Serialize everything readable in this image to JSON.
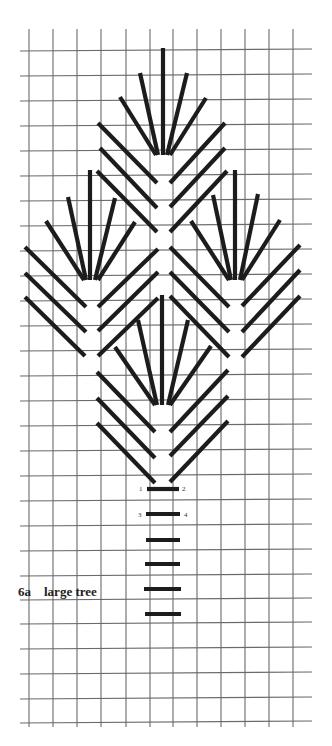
{
  "figure": {
    "id": "6a",
    "title": "large tree"
  },
  "grid": {
    "columns_x": [
      29,
      53,
      77,
      101,
      126,
      150,
      173,
      197,
      221,
      245,
      269,
      293
    ],
    "rows_y": [
      51,
      76,
      101,
      126,
      151,
      176,
      201,
      226,
      251,
      276,
      301,
      326,
      351,
      376,
      401,
      426,
      451,
      476,
      501,
      526,
      551,
      576,
      600,
      624,
      649,
      674,
      699,
      723
    ],
    "h_line_x_range": [
      20,
      312
    ],
    "v_line_y_range": [
      29,
      727
    ],
    "line_color": "#6a6a6a"
  },
  "stitch_color": "#1c1c1c",
  "fans": [
    {
      "name": "top-fan",
      "strokes": [
        [
          163,
          48,
          163,
          155
        ],
        [
          140,
          73,
          158,
          155
        ],
        [
          187,
          73,
          167,
          155
        ],
        [
          120,
          97,
          156,
          155
        ],
        [
          206,
          98,
          170,
          155
        ]
      ]
    },
    {
      "name": "left-fan",
      "strokes": [
        [
          90,
          170,
          90,
          280
        ],
        [
          68,
          197,
          86,
          280
        ],
        [
          115,
          198,
          95,
          280
        ],
        [
          46,
          221,
          84,
          280
        ],
        [
          135,
          222,
          98,
          280
        ]
      ]
    },
    {
      "name": "right-fan",
      "strokes": [
        [
          235,
          170,
          235,
          280
        ],
        [
          213,
          195,
          231,
          280
        ],
        [
          258,
          194,
          240,
          280
        ],
        [
          191,
          221,
          229,
          280
        ],
        [
          280,
          220,
          242,
          280
        ]
      ]
    },
    {
      "name": "bottom-fan",
      "strokes": [
        [
          162,
          295,
          162,
          405
        ],
        [
          138,
          320,
          157,
          405
        ],
        [
          188,
          320,
          168,
          405
        ],
        [
          115,
          347,
          155,
          405
        ],
        [
          211,
          346,
          170,
          405
        ]
      ]
    }
  ],
  "chevrons": [
    {
      "name": "top-chevrons",
      "strokes": [
        [
          98,
          123,
          157,
          183
        ],
        [
          100,
          148,
          157,
          208
        ],
        [
          97,
          171,
          157,
          232
        ],
        [
          225,
          123,
          170,
          183
        ],
        [
          225,
          148,
          170,
          207
        ],
        [
          227,
          171,
          170,
          232
        ]
      ]
    },
    {
      "name": "left-chevrons",
      "strokes": [
        [
          25,
          247,
          86,
          307
        ],
        [
          25,
          273,
          86,
          332
        ],
        [
          25,
          297,
          85,
          356
        ],
        [
          158,
          249,
          98,
          307
        ],
        [
          158,
          272,
          98,
          331
        ],
        [
          158,
          298,
          98,
          356
        ]
      ]
    },
    {
      "name": "right-chevrons",
      "strokes": [
        [
          170,
          247,
          229,
          307
        ],
        [
          170,
          272,
          229,
          332
        ],
        [
          170,
          296,
          229,
          357
        ],
        [
          300,
          245,
          242,
          306
        ],
        [
          300,
          270,
          242,
          332
        ],
        [
          300,
          296,
          242,
          357
        ]
      ]
    },
    {
      "name": "bottom-chevrons",
      "strokes": [
        [
          97,
          372,
          155,
          432
        ],
        [
          97,
          398,
          155,
          458
        ],
        [
          97,
          423,
          155,
          483
        ],
        [
          228,
          370,
          170,
          432
        ],
        [
          228,
          396,
          170,
          456
        ],
        [
          228,
          421,
          170,
          482
        ]
      ]
    }
  ],
  "trunk": {
    "bars": [
      [
        147,
        489,
        179,
        489
      ],
      [
        146,
        514,
        180,
        514
      ],
      [
        146,
        540,
        180,
        540
      ],
      [
        145,
        564,
        180,
        564
      ],
      [
        144,
        589,
        181,
        589
      ],
      [
        145,
        614,
        181,
        614
      ]
    ],
    "stitch_numbers": [
      {
        "label": "1",
        "x": 139,
        "y": 491
      },
      {
        "label": "2",
        "x": 182,
        "y": 491
      },
      {
        "label": "3",
        "x": 138,
        "y": 517
      },
      {
        "label": "4",
        "x": 184,
        "y": 517
      }
    ]
  }
}
